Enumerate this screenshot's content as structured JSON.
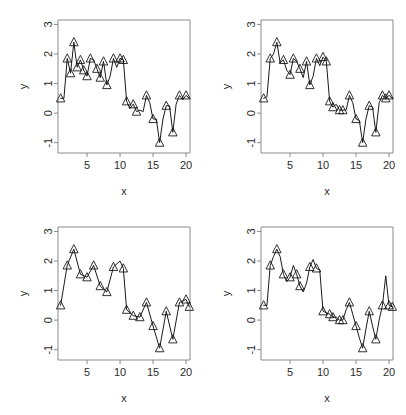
{
  "figure": {
    "layout": "2x2 grid of line plots with triangle markers",
    "panels": [
      {
        "id": "panel-top-left",
        "position": "top-left"
      },
      {
        "id": "panel-top-right",
        "position": "top-right"
      },
      {
        "id": "panel-bottom-left",
        "position": "bottom-left"
      },
      {
        "id": "panel-bottom-right",
        "position": "bottom-right"
      }
    ]
  },
  "axis": {
    "xlabel": "x",
    "ylabel": "y",
    "x_ticks": [
      "5",
      "10",
      "15",
      "20"
    ],
    "y_ticks": [
      "-1",
      "0",
      "1",
      "2",
      "3"
    ]
  },
  "chart_data": [
    {
      "type": "line",
      "title": "",
      "xlabel": "x",
      "ylabel": "y",
      "xlim": [
        0.6,
        20.6
      ],
      "ylim": [
        -1.35,
        3.15
      ],
      "xticks": [
        5,
        10,
        15,
        20
      ],
      "yticks": [
        -1,
        0,
        1,
        2,
        3
      ],
      "grid": false,
      "legend": "none",
      "marker": "triangle-up",
      "series": [
        {
          "name": "observed",
          "x": [
            1,
            1.5,
            2,
            2.5,
            3,
            3.5,
            4,
            4.5,
            5,
            5.5,
            6,
            6.5,
            7,
            7.5,
            8,
            8.5,
            9,
            9.5,
            10,
            10.5,
            11,
            11.5,
            12,
            12.5,
            13,
            13.5,
            14,
            14.5,
            15,
            15.5,
            16,
            16.5,
            17,
            17.5,
            18,
            18.5,
            19,
            19.5,
            20,
            20.5
          ],
          "values": [
            0.5,
            0.5,
            1.85,
            1.35,
            2.4,
            1.55,
            1.8,
            1.45,
            1.25,
            1.85,
            1.8,
            1.5,
            1.2,
            1.75,
            0.95,
            1.25,
            1.85,
            1.55,
            1.85,
            1.8,
            0.4,
            0.15,
            0.3,
            0.05,
            0.1,
            0.05,
            0.6,
            0.35,
            -0.2,
            -0.2,
            -1.0,
            -0.2,
            0.25,
            0.25,
            -0.65,
            0.3,
            0.6,
            0.45,
            0.6,
            0.5
          ],
          "markers": [
            0.5,
            null,
            1.85,
            1.35,
            2.4,
            1.55,
            1.8,
            1.45,
            1.25,
            1.85,
            null,
            1.5,
            1.2,
            1.75,
            0.95,
            null,
            1.85,
            null,
            1.85,
            1.8,
            0.4,
            null,
            0.3,
            0.05,
            null,
            null,
            0.6,
            null,
            -0.2,
            null,
            -1.0,
            null,
            0.25,
            null,
            -0.65,
            null,
            0.6,
            null,
            0.6,
            null
          ]
        }
      ],
      "roughness": "high"
    },
    {
      "type": "line",
      "title": "",
      "xlabel": "x",
      "ylabel": "y",
      "xlim": [
        0.6,
        20.6
      ],
      "ylim": [
        -1.35,
        3.15
      ],
      "xticks": [
        5,
        10,
        15,
        20
      ],
      "yticks": [
        -1,
        0,
        1,
        2,
        3
      ],
      "grid": false,
      "legend": "none",
      "marker": "triangle-up",
      "series": [
        {
          "name": "smoothed-1",
          "x": [
            1,
            1.5,
            2,
            2.5,
            3,
            3.5,
            4,
            4.5,
            5,
            5.5,
            6,
            6.5,
            7,
            7.5,
            8,
            8.5,
            9,
            9.5,
            10,
            10.5,
            11,
            11.5,
            12,
            12.5,
            13,
            13.5,
            14,
            14.5,
            15,
            15.5,
            16,
            16.5,
            17,
            17.5,
            18,
            18.5,
            19,
            19.5,
            20,
            20.5
          ],
          "values": [
            0.5,
            0.55,
            1.85,
            2.0,
            2.4,
            1.7,
            1.8,
            1.45,
            1.3,
            1.85,
            1.75,
            1.5,
            1.2,
            1.75,
            0.95,
            1.25,
            1.85,
            1.6,
            1.9,
            1.75,
            0.4,
            0.2,
            0.3,
            0.1,
            0.1,
            0.1,
            0.6,
            0.35,
            -0.2,
            -0.25,
            -1.0,
            -0.2,
            0.25,
            0.2,
            -0.65,
            0.35,
            0.6,
            0.5,
            0.6,
            0.5
          ],
          "markers": [
            0.5,
            null,
            1.85,
            null,
            2.4,
            null,
            1.8,
            null,
            1.3,
            1.85,
            null,
            1.5,
            null,
            1.75,
            0.95,
            null,
            1.85,
            null,
            1.9,
            1.75,
            0.4,
            0.2,
            null,
            0.1,
            0.1,
            null,
            0.6,
            null,
            -0.2,
            null,
            -1.0,
            null,
            0.25,
            null,
            -0.65,
            null,
            0.6,
            0.5,
            0.6,
            null
          ]
        }
      ],
      "roughness": "medium"
    },
    {
      "type": "line",
      "title": "",
      "xlabel": "x",
      "ylabel": "y",
      "xlim": [
        0.6,
        20.6
      ],
      "ylim": [
        -1.35,
        3.15
      ],
      "xticks": [
        5,
        10,
        15,
        20
      ],
      "yticks": [
        -1,
        0,
        1,
        2,
        3
      ],
      "grid": false,
      "legend": "none",
      "marker": "triangle-up",
      "series": [
        {
          "name": "smoothed-2",
          "x": [
            1,
            2,
            3,
            4,
            5,
            6,
            7,
            8,
            9,
            10,
            10.5,
            11,
            12,
            13,
            14,
            15,
            16,
            17,
            18,
            19,
            20,
            20.5
          ],
          "values": [
            0.5,
            1.85,
            2.4,
            1.55,
            1.45,
            1.85,
            1.15,
            0.95,
            1.8,
            2.0,
            1.75,
            0.35,
            0.15,
            0.1,
            0.6,
            -0.2,
            -0.95,
            0.3,
            -0.65,
            0.6,
            0.7,
            0.45
          ],
          "markers": [
            0.5,
            1.85,
            2.4,
            1.55,
            1.45,
            1.85,
            1.15,
            0.95,
            1.8,
            null,
            1.75,
            0.35,
            0.15,
            0.1,
            0.6,
            -0.2,
            -0.95,
            0.3,
            -0.65,
            0.6,
            0.7,
            0.45
          ]
        }
      ],
      "roughness": "low"
    },
    {
      "type": "line",
      "title": "",
      "xlabel": "x",
      "ylabel": "y",
      "xlim": [
        0.6,
        20.6
      ],
      "ylim": [
        -1.35,
        3.15
      ],
      "xticks": [
        5,
        10,
        15,
        20
      ],
      "yticks": [
        -1,
        0,
        1,
        2,
        3
      ],
      "grid": false,
      "legend": "none",
      "marker": "triangle-up",
      "series": [
        {
          "name": "smoothed-3",
          "x": [
            1,
            1.5,
            2,
            2.5,
            3,
            3.5,
            4,
            4.5,
            5,
            5.5,
            6,
            6.5,
            7,
            7.5,
            8,
            8.5,
            9,
            9.5,
            10,
            10.5,
            11,
            11.5,
            12,
            12.5,
            13,
            13.5,
            14,
            14.5,
            15,
            15.5,
            16,
            16.5,
            17,
            17.5,
            18,
            18.5,
            19,
            19.5,
            20,
            20.5
          ],
          "values": [
            0.5,
            0.5,
            1.85,
            2.15,
            2.4,
            2.15,
            1.55,
            1.3,
            1.45,
            1.85,
            1.55,
            1.15,
            0.95,
            1.25,
            1.8,
            2.05,
            1.75,
            1.7,
            0.3,
            0.25,
            0.2,
            0.1,
            0.1,
            0.0,
            0.0,
            0.35,
            0.6,
            0.2,
            -0.2,
            -0.6,
            -0.95,
            -0.3,
            0.3,
            -0.2,
            -0.65,
            0.0,
            0.5,
            1.5,
            0.5,
            0.45
          ],
          "markers": [
            0.5,
            null,
            1.85,
            null,
            2.4,
            null,
            1.55,
            null,
            1.45,
            null,
            1.55,
            1.15,
            null,
            null,
            1.8,
            null,
            1.75,
            null,
            0.3,
            null,
            0.2,
            0.1,
            null,
            0.0,
            0.0,
            null,
            0.6,
            null,
            -0.2,
            null,
            -0.95,
            null,
            0.3,
            null,
            -0.65,
            null,
            0.5,
            null,
            0.5,
            0.45
          ]
        }
      ],
      "roughness": "medium-high"
    }
  ]
}
